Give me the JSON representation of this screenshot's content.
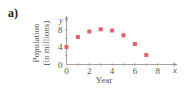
{
  "panel_label": "a)",
  "chart_data": {
    "type": "scatter",
    "title": "",
    "xlabel": "Year",
    "ylabel": "Population (in millions)",
    "ylabel_lines": [
      "Population",
      "(in millions)"
    ],
    "x_axis_var": "x",
    "y_axis_var": "y",
    "x": [
      0,
      1,
      2,
      3,
      4,
      5,
      6,
      7
    ],
    "y": [
      4.0,
      6.3,
      7.6,
      8.1,
      7.8,
      6.7,
      4.7,
      2.2
    ],
    "xlim": [
      0,
      9
    ],
    "ylim": [
      0,
      10
    ],
    "xticks": [
      0,
      2,
      4,
      6,
      8
    ],
    "yticks": [
      0,
      4,
      8
    ],
    "xtick_labels": [
      "0",
      "2",
      "4",
      "6",
      "8"
    ],
    "ytick_labels": [
      "0",
      "4",
      "8"
    ],
    "grid": false,
    "legend": null,
    "marker_color": "#e8606a",
    "axis_color": "#8a8a8a"
  }
}
